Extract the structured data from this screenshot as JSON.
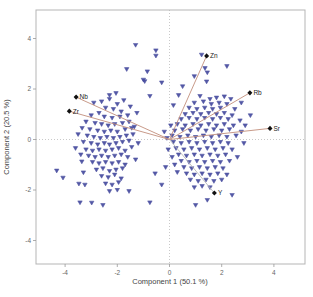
{
  "chart_data": {
    "type": "scatter",
    "title": "",
    "xlabel": "Component 1 (50.1 %)",
    "ylabel": "Component 2 (20.5 %)",
    "xlim": [
      -5.1,
      5.2
    ],
    "ylim": [
      -4.9,
      5.1
    ],
    "x_ticks": [
      -4,
      -2,
      0,
      2,
      4
    ],
    "y_ticks": [
      -4,
      -2,
      0,
      2,
      4
    ],
    "grid": "dotted zero reference lines only",
    "legend": "none",
    "point_marker": "down-triangle",
    "point_color": "#454a9e",
    "frame_color": "#b5b5b5",
    "zero_line_color": "#c9c9c9",
    "vector_color": "#c28e7c",
    "loading_marker_color": "#111111",
    "loadings": [
      {
        "label": "Zn",
        "x": 1.42,
        "y": 3.31,
        "line_color": "#c28e7c"
      },
      {
        "label": "Rb",
        "x": 3.08,
        "y": 1.85,
        "line_color": "#c28e7c"
      },
      {
        "label": "Sr",
        "x": 3.85,
        "y": 0.44,
        "line_color": "#c28e7c"
      },
      {
        "label": "Nb",
        "x": -3.58,
        "y": 1.68,
        "line_color": "#c28e7c"
      },
      {
        "label": "Zr",
        "x": -3.84,
        "y": 1.12,
        "line_color": "#c28e7c"
      },
      {
        "label": "Y",
        "x": 1.72,
        "y": -2.12,
        "line_color": "#b9b9b9"
      }
    ],
    "points": [
      [
        -1.3,
        3.74
      ],
      [
        -0.52,
        3.52
      ],
      [
        -0.52,
        3.31
      ],
      [
        -1.64,
        2.78
      ],
      [
        -0.85,
        2.69
      ],
      [
        -1.0,
        2.36
      ],
      [
        -0.95,
        2.3
      ],
      [
        -0.3,
        2.25
      ],
      [
        -2.05,
        1.83
      ],
      [
        -0.75,
        1.72
      ],
      [
        1.23,
        3.35
      ],
      [
        1.36,
        2.82
      ],
      [
        1.42,
        2.29
      ],
      [
        1.17,
        1.72
      ],
      [
        2.2,
        2.9
      ],
      [
        1.45,
        2.65
      ],
      [
        0.5,
        2.1
      ],
      [
        0.35,
        1.75
      ],
      [
        0.15,
        1.35
      ],
      [
        2.75,
        1.45
      ],
      [
        0.95,
        2.5
      ],
      [
        -2.9,
        1.45
      ],
      [
        -2.6,
        1.5
      ],
      [
        -2.3,
        1.6
      ],
      [
        -2.0,
        1.4
      ],
      [
        -2.45,
        1.25
      ],
      [
        -2.15,
        1.2
      ],
      [
        -1.85,
        1.1
      ],
      [
        -2.7,
        1.05
      ],
      [
        -3.0,
        0.95
      ],
      [
        -2.5,
        0.9
      ],
      [
        -2.2,
        0.85
      ],
      [
        -1.9,
        0.9
      ],
      [
        -1.6,
        0.95
      ],
      [
        -3.2,
        0.7
      ],
      [
        -2.85,
        0.65
      ],
      [
        -2.6,
        0.6
      ],
      [
        -2.35,
        0.55
      ],
      [
        -2.1,
        0.6
      ],
      [
        -1.8,
        0.65
      ],
      [
        -1.55,
        0.7
      ],
      [
        -3.35,
        0.45
      ],
      [
        -3.05,
        0.4
      ],
      [
        -2.75,
        0.35
      ],
      [
        -2.5,
        0.3
      ],
      [
        -2.25,
        0.35
      ],
      [
        -2.0,
        0.3
      ],
      [
        -1.7,
        0.4
      ],
      [
        -1.45,
        0.45
      ],
      [
        -3.5,
        0.2
      ],
      [
        -3.15,
        0.15
      ],
      [
        -2.9,
        0.1
      ],
      [
        -2.65,
        0.05
      ],
      [
        -2.4,
        0.1
      ],
      [
        -2.15,
        0.05
      ],
      [
        -1.9,
        0.1
      ],
      [
        -1.65,
        0.15
      ],
      [
        -1.4,
        0.2
      ],
      [
        -3.3,
        -0.1
      ],
      [
        -3.0,
        -0.15
      ],
      [
        -2.75,
        -0.2
      ],
      [
        -2.5,
        -0.15
      ],
      [
        -2.3,
        -0.2
      ],
      [
        -2.05,
        -0.15
      ],
      [
        -1.8,
        -0.1
      ],
      [
        -1.55,
        -0.05
      ],
      [
        -3.6,
        -0.35
      ],
      [
        -3.2,
        -0.4
      ],
      [
        -2.95,
        -0.45
      ],
      [
        -2.7,
        -0.4
      ],
      [
        -2.45,
        -0.45
      ],
      [
        -2.2,
        -0.4
      ],
      [
        -1.95,
        -0.35
      ],
      [
        -1.7,
        -0.45
      ],
      [
        -1.45,
        -0.3
      ],
      [
        -3.4,
        -0.6
      ],
      [
        -3.1,
        -0.65
      ],
      [
        -2.85,
        -0.7
      ],
      [
        -2.6,
        -0.65
      ],
      [
        -2.35,
        -0.7
      ],
      [
        -2.1,
        -0.65
      ],
      [
        -1.85,
        -0.6
      ],
      [
        -1.6,
        -0.7
      ],
      [
        -2.95,
        -0.9
      ],
      [
        -2.7,
        -0.95
      ],
      [
        -2.45,
        -0.9
      ],
      [
        -2.2,
        -0.95
      ],
      [
        -1.95,
        -0.9
      ],
      [
        -1.7,
        -1.0
      ],
      [
        -2.8,
        -1.2
      ],
      [
        -2.55,
        -1.15
      ],
      [
        -2.3,
        -1.25
      ],
      [
        -2.05,
        -1.2
      ],
      [
        -1.8,
        -1.15
      ],
      [
        -2.6,
        -1.45
      ],
      [
        -2.35,
        -1.5
      ],
      [
        -2.1,
        -1.4
      ],
      [
        -1.85,
        -1.55
      ],
      [
        -2.45,
        -1.75
      ],
      [
        -2.2,
        -1.8
      ],
      [
        -1.95,
        -1.7
      ],
      [
        -2.3,
        -2.05
      ],
      [
        -2.0,
        -2.0
      ],
      [
        -2.55,
        -2.6
      ],
      [
        -3.43,
        -2.5
      ],
      [
        -1.55,
        -2.05
      ],
      [
        -4.32,
        -1.24
      ],
      [
        -4.08,
        -1.52
      ],
      [
        -3.36,
        -0.88
      ],
      [
        -3.3,
        -1.31
      ],
      [
        -3.47,
        -1.76
      ],
      [
        -3.24,
        -1.8
      ],
      [
        -2.98,
        -2.51
      ],
      [
        -2.3,
        1.75
      ],
      [
        -1.75,
        1.55
      ],
      [
        -1.5,
        1.3
      ],
      [
        -1.25,
        1.05
      ],
      [
        -1.35,
        0.5
      ],
      [
        -1.2,
        -0.15
      ],
      [
        -1.3,
        -0.8
      ],
      [
        -0.75,
        -2.5
      ],
      [
        -0.55,
        -1.35
      ],
      [
        -0.3,
        -1.8
      ],
      [
        1.55,
        1.6
      ],
      [
        1.8,
        1.65
      ],
      [
        2.1,
        1.7
      ],
      [
        2.35,
        1.6
      ],
      [
        0.95,
        1.45
      ],
      [
        1.3,
        1.5
      ],
      [
        1.6,
        1.4
      ],
      [
        1.9,
        1.45
      ],
      [
        2.2,
        1.4
      ],
      [
        0.75,
        1.25
      ],
      [
        1.05,
        1.2
      ],
      [
        1.35,
        1.25
      ],
      [
        1.65,
        1.2
      ],
      [
        1.95,
        1.25
      ],
      [
        2.5,
        1.2
      ],
      [
        0.6,
        1.0
      ],
      [
        0.9,
        1.05
      ],
      [
        1.2,
        1.0
      ],
      [
        1.5,
        1.05
      ],
      [
        1.8,
        1.0
      ],
      [
        2.1,
        1.05
      ],
      [
        2.4,
        0.95
      ],
      [
        0.45,
        0.8
      ],
      [
        0.75,
        0.85
      ],
      [
        1.05,
        0.8
      ],
      [
        1.35,
        0.85
      ],
      [
        1.65,
        0.8
      ],
      [
        1.95,
        0.85
      ],
      [
        2.25,
        0.8
      ],
      [
        2.7,
        0.75
      ],
      [
        0.3,
        0.6
      ],
      [
        0.6,
        0.55
      ],
      [
        0.9,
        0.6
      ],
      [
        1.2,
        0.55
      ],
      [
        1.5,
        0.6
      ],
      [
        1.8,
        0.55
      ],
      [
        2.1,
        0.6
      ],
      [
        2.45,
        0.55
      ],
      [
        0.2,
        0.35
      ],
      [
        0.5,
        0.4
      ],
      [
        0.8,
        0.35
      ],
      [
        1.1,
        0.4
      ],
      [
        1.4,
        0.35
      ],
      [
        1.7,
        0.4
      ],
      [
        2.0,
        0.35
      ],
      [
        2.3,
        0.4
      ],
      [
        2.75,
        0.3
      ],
      [
        0.1,
        0.15
      ],
      [
        0.4,
        0.1
      ],
      [
        0.7,
        0.15
      ],
      [
        1.0,
        0.1
      ],
      [
        1.3,
        0.15
      ],
      [
        1.6,
        0.1
      ],
      [
        1.9,
        0.15
      ],
      [
        2.2,
        0.1
      ],
      [
        2.55,
        0.15
      ],
      [
        0.15,
        -0.1
      ],
      [
        0.45,
        -0.15
      ],
      [
        0.75,
        -0.1
      ],
      [
        1.05,
        -0.15
      ],
      [
        1.35,
        -0.1
      ],
      [
        1.65,
        -0.15
      ],
      [
        1.95,
        -0.1
      ],
      [
        2.25,
        -0.15
      ],
      [
        0.25,
        -0.35
      ],
      [
        0.55,
        -0.4
      ],
      [
        0.85,
        -0.35
      ],
      [
        1.15,
        -0.4
      ],
      [
        1.45,
        -0.35
      ],
      [
        1.75,
        -0.4
      ],
      [
        2.05,
        -0.35
      ],
      [
        2.4,
        -0.4
      ],
      [
        0.35,
        -0.6
      ],
      [
        0.65,
        -0.65
      ],
      [
        0.95,
        -0.6
      ],
      [
        1.25,
        -0.65
      ],
      [
        1.55,
        -0.6
      ],
      [
        1.85,
        -0.65
      ],
      [
        2.15,
        -0.6
      ],
      [
        0.45,
        -0.85
      ],
      [
        0.75,
        -0.9
      ],
      [
        1.05,
        -0.85
      ],
      [
        1.35,
        -0.9
      ],
      [
        1.65,
        -0.85
      ],
      [
        1.95,
        -0.9
      ],
      [
        2.3,
        -0.85
      ],
      [
        0.55,
        -1.1
      ],
      [
        0.85,
        -1.15
      ],
      [
        1.15,
        -1.1
      ],
      [
        1.45,
        -1.15
      ],
      [
        1.75,
        -1.1
      ],
      [
        2.05,
        -1.15
      ],
      [
        0.65,
        -1.35
      ],
      [
        0.95,
        -1.4
      ],
      [
        1.25,
        -1.35
      ],
      [
        1.55,
        -1.4
      ],
      [
        1.85,
        -1.35
      ],
      [
        2.2,
        -1.4
      ],
      [
        0.8,
        -1.6
      ],
      [
        1.1,
        -1.65
      ],
      [
        1.4,
        -1.6
      ],
      [
        1.7,
        -1.65
      ],
      [
        2.0,
        -1.6
      ],
      [
        0.95,
        -1.9
      ],
      [
        1.25,
        -1.85
      ],
      [
        1.55,
        -1.9
      ],
      [
        2.4,
        -2.2
      ],
      [
        1.0,
        -2.6
      ],
      [
        1.45,
        -2.4
      ],
      [
        0.3,
        -1.3
      ],
      [
        0.2,
        -1.0
      ],
      [
        0.1,
        -0.7
      ],
      [
        -0.05,
        -0.4
      ],
      [
        -0.1,
        0.05
      ],
      [
        2.9,
        0.55
      ],
      [
        3.1,
        0.95
      ],
      [
        2.6,
        -0.7
      ],
      [
        2.85,
        -0.15
      ],
      [
        -0.15,
        -1.1
      ],
      [
        0.05,
        0.55
      ],
      [
        -0.2,
        0.3
      ]
    ]
  }
}
